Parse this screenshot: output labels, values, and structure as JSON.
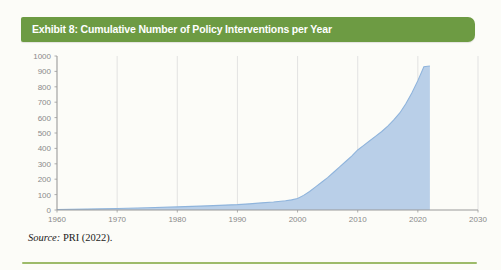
{
  "banner": {
    "title": "Exhibit 8: Cumulative Number of Policy Interventions per Year",
    "color": "#6d9b43"
  },
  "caption": {
    "source_label": "Source:",
    "source_text": " PRI (2022)."
  },
  "rule": {
    "color": "#9dbb6a"
  },
  "chart_data": {
    "type": "area",
    "title": "Exhibit 8: Cumulative Number of Policy Interventions per Year",
    "xlabel": "",
    "ylabel": "",
    "xlim": [
      1960,
      2030
    ],
    "ylim": [
      0,
      1000
    ],
    "grid": "vertical",
    "legend": "none",
    "series_name": "Cumulative number of policy interventions",
    "line_color": "#8fb4dc",
    "fill_color": "#b9cfe8",
    "xticks": [
      1960,
      1970,
      1980,
      1990,
      2000,
      2010,
      2020,
      2030
    ],
    "yticks": [
      0,
      100,
      200,
      300,
      400,
      500,
      600,
      700,
      800,
      900,
      1000
    ],
    "x": [
      1960,
      1965,
      1970,
      1975,
      1980,
      1985,
      1990,
      1992,
      1994,
      1996,
      1998,
      1999,
      2000,
      2001,
      2002,
      2003,
      2004,
      2005,
      2006,
      2007,
      2008,
      2009,
      2010,
      2011,
      2012,
      2013,
      2014,
      2015,
      2016,
      2017,
      2018,
      2019,
      2020,
      2021,
      2022
    ],
    "values": [
      3,
      6,
      10,
      15,
      20,
      27,
      35,
      40,
      46,
      52,
      60,
      66,
      75,
      95,
      120,
      150,
      180,
      210,
      245,
      280,
      315,
      350,
      390,
      420,
      450,
      480,
      510,
      545,
      585,
      630,
      690,
      760,
      840,
      930,
      935
    ]
  }
}
